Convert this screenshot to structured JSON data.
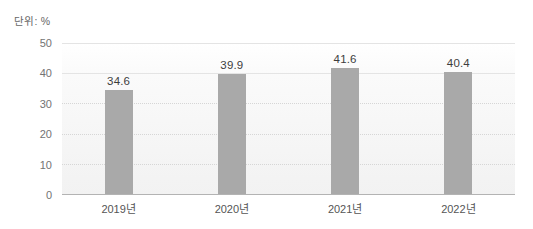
{
  "unit_label": "단위: %",
  "chart_data": {
    "type": "bar",
    "title": "",
    "xlabel": "",
    "ylabel": "단위: %",
    "categories": [
      "2019년",
      "2020년",
      "2021년",
      "2022년"
    ],
    "values": [
      34.6,
      39.9,
      41.6,
      40.4
    ],
    "value_labels": [
      "34.6",
      "39.9",
      "41.6",
      "40.4"
    ],
    "ylim": [
      0,
      50
    ],
    "yticks": [
      50,
      40,
      30,
      20,
      10,
      0
    ],
    "grid": "horizontal",
    "legend": "none"
  },
  "colors": {
    "bar": "#a9a9a9",
    "axis_line": "#b3b3b3",
    "grid_solid": "#e4e4e4",
    "grid_dotted": "#d6d6d6",
    "tick_text": "#737373",
    "value_text": "#3d3d3d"
  }
}
